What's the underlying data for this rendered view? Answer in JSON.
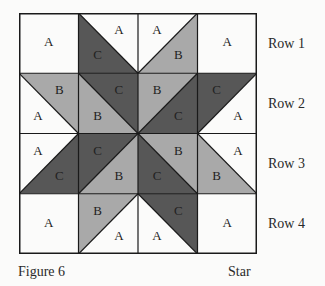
{
  "colors": {
    "A": "#fbfbfa",
    "B": "#a9a9a9",
    "C": "#575757",
    "line": "#1a1a1a"
  },
  "grid": {
    "rows": 4,
    "cols": 4,
    "cells": [
      [
        {
          "type": "plain",
          "fill": "A",
          "label": "A"
        },
        {
          "type": "diag",
          "dir": "tl-br",
          "upper": "A",
          "lower": "C"
        },
        {
          "type": "diag",
          "dir": "tr-bl",
          "upper": "A",
          "lower": "B"
        },
        {
          "type": "plain",
          "fill": "A",
          "label": "A"
        }
      ],
      [
        {
          "type": "diag",
          "dir": "tl-br",
          "upper": "B",
          "lower": "A"
        },
        {
          "type": "diag",
          "dir": "tl-br",
          "upper": "C",
          "lower": "B"
        },
        {
          "type": "diag",
          "dir": "tr-bl",
          "upper": "B",
          "lower": "C"
        },
        {
          "type": "diag",
          "dir": "tr-bl",
          "upper": "C",
          "lower": "A"
        }
      ],
      [
        {
          "type": "diag",
          "dir": "tr-bl",
          "upper": "A",
          "lower": "C"
        },
        {
          "type": "diag",
          "dir": "tr-bl",
          "upper": "C",
          "lower": "B"
        },
        {
          "type": "diag",
          "dir": "tl-br",
          "upper": "B",
          "lower": "C"
        },
        {
          "type": "diag",
          "dir": "tl-br",
          "upper": "A",
          "lower": "B"
        }
      ],
      [
        {
          "type": "plain",
          "fill": "A",
          "label": "A"
        },
        {
          "type": "diag",
          "dir": "tr-bl",
          "upper": "B",
          "lower": "A"
        },
        {
          "type": "diag",
          "dir": "tl-br",
          "upper": "C",
          "lower": "A"
        },
        {
          "type": "plain",
          "fill": "A",
          "label": "A"
        }
      ]
    ]
  },
  "row_labels": [
    "Row 1",
    "Row 2",
    "Row 3",
    "Row 4"
  ],
  "caption": {
    "figure": "Figure 6",
    "name": "Star"
  }
}
